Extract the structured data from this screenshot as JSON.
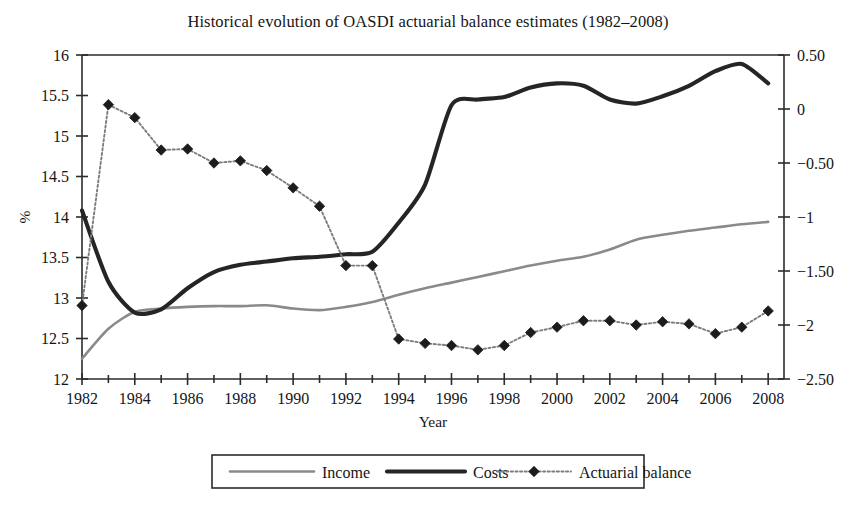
{
  "chart_data": {
    "type": "line",
    "title": "Historical evolution of OASDI actuarial balance estimates (1982–2008)",
    "xlabel": "Year",
    "ylabel": "%",
    "y2label": "",
    "grid": false,
    "legend_position": "bottom",
    "xlim": [
      1982,
      2008.6
    ],
    "ylim": [
      12,
      16
    ],
    "y2lim": [
      -2.5,
      0.5
    ],
    "xticks": [
      1982,
      1984,
      1986,
      1988,
      1990,
      1992,
      1994,
      1996,
      1998,
      2000,
      2002,
      2004,
      2006,
      2008
    ],
    "xtick_labels": [
      "1982",
      "1984",
      "1986",
      "1988",
      "1990",
      "1992",
      "1994",
      "1996",
      "1998",
      "2000",
      "2002",
      "2004",
      "2006",
      "2008"
    ],
    "xminorticks": [
      1983,
      1985,
      1987,
      1989,
      1991,
      1993,
      1995,
      1997,
      1999,
      2001,
      2003,
      2005,
      2007
    ],
    "yticks": [
      12,
      12.5,
      13,
      13.5,
      14,
      14.5,
      15,
      15.5,
      16
    ],
    "ytick_labels": [
      "12",
      "12.5",
      "13",
      "13.5",
      "14",
      "14.5",
      "15",
      "15.5",
      "16"
    ],
    "y2ticks": [
      -2.5,
      -2,
      -1.5,
      -1,
      -0.5,
      0,
      0.5
    ],
    "y2tick_labels": [
      "−2.50",
      "−2",
      "−1.50",
      "−1",
      "−0.50",
      "0",
      "0.50"
    ],
    "x": [
      1982,
      1983,
      1984,
      1985,
      1986,
      1987,
      1988,
      1989,
      1990,
      1991,
      1992,
      1993,
      1994,
      1995,
      1996,
      1997,
      1998,
      1999,
      2000,
      2001,
      2002,
      2003,
      2004,
      2005,
      2006,
      2007,
      2008
    ],
    "series": [
      {
        "name": "Income",
        "axis": "left",
        "style": "thin-gray-line",
        "values": [
          12.25,
          12.62,
          12.83,
          12.87,
          12.89,
          12.9,
          12.9,
          12.91,
          12.87,
          12.85,
          12.89,
          12.95,
          13.04,
          13.12,
          13.19,
          13.26,
          13.33,
          13.4,
          13.46,
          13.51,
          13.6,
          13.72,
          13.78,
          13.83,
          13.87,
          13.91,
          13.94
        ]
      },
      {
        "name": "Costs",
        "axis": "left",
        "style": "thick-black-line",
        "values": [
          14.08,
          13.2,
          12.82,
          12.86,
          13.12,
          13.32,
          13.41,
          13.45,
          13.49,
          13.51,
          13.54,
          13.57,
          13.93,
          14.4,
          15.38,
          15.45,
          15.48,
          15.6,
          15.65,
          15.62,
          15.45,
          15.4,
          15.49,
          15.62,
          15.8,
          15.89,
          15.65
        ]
      },
      {
        "name": "Actuarial balance",
        "axis": "right",
        "style": "dotted-diamond-markers",
        "values": [
          -1.82,
          0.04,
          -0.08,
          -0.38,
          -0.37,
          -0.5,
          -0.48,
          -0.57,
          -0.73,
          -0.9,
          -1.45,
          -1.45,
          -2.13,
          -2.17,
          -2.19,
          -2.23,
          -2.19,
          -2.07,
          -2.02,
          -1.96,
          -1.96,
          -2.0,
          -1.97,
          -1.99,
          -2.08,
          -2.02,
          -1.87
        ]
      }
    ],
    "legend": [
      {
        "label": "Income",
        "style": "thin-gray-line"
      },
      {
        "label": "Costs",
        "style": "thick-black-line"
      },
      {
        "label": "Actuarial balance",
        "style": "dotted-diamond-markers"
      }
    ],
    "colors": {
      "income": "#8a8a8a",
      "costs": "#252525",
      "balance_line": "#7d7d7d",
      "balance_marker": "#1c1c1c",
      "axis": "#2b2b2b",
      "text": "#151515",
      "background": "#ffffff"
    }
  }
}
